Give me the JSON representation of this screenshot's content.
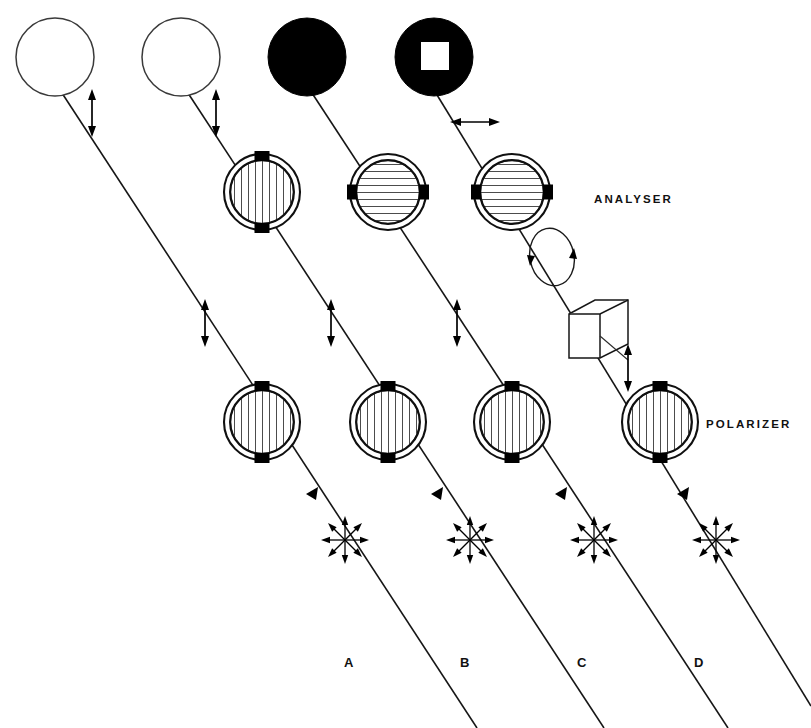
{
  "figure": {
    "background_color": "#ffffff",
    "ink_color": "#000000",
    "width": 811,
    "height": 728
  },
  "labels": {
    "analyser": "ANALYSER",
    "polarizer": "POLARIZER"
  },
  "columns": [
    {
      "id": "A",
      "label": "A",
      "label_x": 348,
      "label_y": 662,
      "beam_top_x": 60,
      "beam_bottom_x": 477,
      "polarizer": {
        "cx": 262,
        "cy": 422,
        "orientation": "vertical"
      },
      "analyser": null,
      "extra_elements": [],
      "result_spot": {
        "cx": 55,
        "cy": 57,
        "r": 39,
        "fill": "white",
        "inner": null
      },
      "output_polarization": {
        "type": "linear-vertical",
        "x": 92,
        "y": 113
      },
      "mid_polarization": {
        "type": "linear-vertical",
        "x": 205,
        "y": 323
      },
      "source_star": {
        "cx": 345,
        "cy": 540
      },
      "ray_arrow": {
        "x": 318,
        "y": 487
      }
    },
    {
      "id": "B",
      "label": "B",
      "label_x": 463,
      "label_y": 662,
      "beam_top_x": 186,
      "beam_bottom_x": 604,
      "polarizer": {
        "cx": 388,
        "cy": 422,
        "orientation": "vertical"
      },
      "analyser": {
        "cx": 262,
        "cy": 192,
        "orientation": "vertical"
      },
      "extra_elements": [],
      "result_spot": {
        "cx": 181,
        "cy": 57,
        "r": 39,
        "fill": "white",
        "inner": null
      },
      "output_polarization": {
        "type": "linear-vertical",
        "x": 216,
        "y": 113
      },
      "mid_polarization": {
        "type": "linear-vertical",
        "x": 331,
        "y": 323
      },
      "source_star": {
        "cx": 470,
        "cy": 540
      },
      "ray_arrow": {
        "x": 443,
        "y": 487
      }
    },
    {
      "id": "C",
      "label": "C",
      "label_x": 580,
      "label_y": 662,
      "beam_top_x": 310,
      "beam_bottom_x": 728,
      "polarizer": {
        "cx": 512,
        "cy": 422,
        "orientation": "vertical"
      },
      "analyser": {
        "cx": 388,
        "cy": 192,
        "orientation": "horizontal"
      },
      "extra_elements": [],
      "result_spot": {
        "cx": 307,
        "cy": 57,
        "r": 39,
        "fill": "black",
        "inner": null
      },
      "output_polarization": null,
      "mid_polarization": {
        "type": "linear-vertical",
        "x": 457,
        "y": 323
      },
      "source_star": {
        "cx": 594,
        "cy": 540
      },
      "ray_arrow": {
        "x": 567,
        "y": 487
      }
    },
    {
      "id": "D",
      "label": "D",
      "label_x": 697,
      "label_y": 662,
      "beam_top_x": 434,
      "beam_bottom_x": 811,
      "polarizer": {
        "cx": 660,
        "cy": 422,
        "orientation": "vertical"
      },
      "analyser": {
        "cx": 512,
        "cy": 192,
        "orientation": "horizontal"
      },
      "extra_elements": [
        "circular-polarization-ellipse",
        "quarter-wave-cube"
      ],
      "result_spot": {
        "cx": 434,
        "cy": 57,
        "r": 39,
        "fill": "black",
        "inner": "white-square"
      },
      "output_polarization": {
        "type": "linear-horizontal",
        "x": 475,
        "y": 122
      },
      "mid_polarization": {
        "type": "linear-vertical",
        "x": 628,
        "y": 368
      },
      "source_star": {
        "cx": 716,
        "cy": 540
      },
      "ray_arrow": {
        "x": 689,
        "y": 487
      }
    }
  ],
  "symbols": {
    "unpolarized_light": "starburst-8-arrows",
    "linear_vertical": "double-headed-vertical-arrow",
    "linear_horizontal": "double-headed-horizontal-arrow",
    "circular_polarization": "ellipse-with-circulating-arrows",
    "quarter_wave_plate": "isometric-cube",
    "polarizing_filter": "hatched-disc-with-tabs"
  },
  "observations": {
    "A": "bright field (no analyser)",
    "C": "extinction (crossed polarizer and analyser)",
    "D": "partial transmission with bright square region"
  }
}
